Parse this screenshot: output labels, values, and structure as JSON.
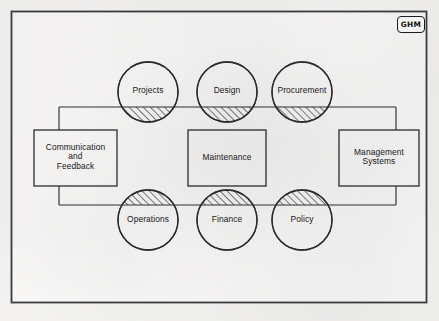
{
  "document": {
    "type": "systems-diagram",
    "logo": {
      "name": "ghm-logo",
      "text": "GHM"
    },
    "frame": {
      "border_color": "#3a3c3e",
      "paper_color": "#f6f5f3"
    }
  },
  "diagram": {
    "title": "",
    "line_color": "#2c2e30",
    "hatch_color": "#1f2123",
    "nodes": {
      "top_circles": [
        {
          "id": "projects",
          "label": "Projects",
          "cx": 148,
          "cy": 92,
          "r": 30,
          "hatch": "bottom-segment"
        },
        {
          "id": "design",
          "label": "Design",
          "cx": 227,
          "cy": 92,
          "r": 30,
          "hatch": "bottom-segment"
        },
        {
          "id": "procurement",
          "label": "Procurement",
          "cx": 302,
          "cy": 92,
          "r": 30,
          "hatch": "bottom-segment"
        }
      ],
      "bottom_circles": [
        {
          "id": "operations",
          "label": "Operations",
          "cx": 148,
          "cy": 220,
          "r": 30,
          "hatch": "top-segment"
        },
        {
          "id": "finance",
          "label": "Finance",
          "cx": 227,
          "cy": 220,
          "r": 30,
          "hatch": "top-segment"
        },
        {
          "id": "policy",
          "label": "Policy",
          "cx": 302,
          "cy": 220,
          "r": 30,
          "hatch": "top-segment"
        }
      ],
      "boxes": [
        {
          "id": "communication-and-feedback",
          "label": "Communication\nand\nFeedback",
          "x": 34,
          "y": 130,
          "w": 83,
          "h": 56
        },
        {
          "id": "maintenance",
          "label": "Maintenance",
          "x": 188,
          "y": 130,
          "w": 78,
          "h": 56
        },
        {
          "id": "management-systems",
          "label": "Management\nSystems",
          "x": 339,
          "y": 130,
          "w": 80,
          "h": 56
        }
      ]
    },
    "connector_loop": {
      "left_x": 59,
      "right_x": 396,
      "top_y": 107,
      "bottom_y": 205
    }
  }
}
